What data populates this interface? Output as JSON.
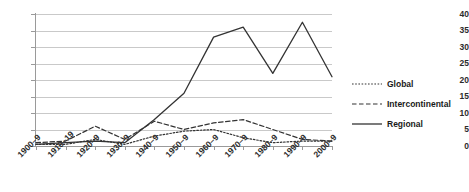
{
  "chart_data": {
    "type": "line",
    "title": "",
    "xlabel": "",
    "ylabel": "",
    "ylim": [
      0,
      40
    ],
    "ytick_step": 5,
    "grid": true,
    "legend_position": "right",
    "categories": [
      "1900–9",
      "1910–19",
      "1920–9",
      "1930–9",
      "1940–9",
      "1950–9",
      "1960–9",
      "1970–9",
      "1980–9",
      "1990–9",
      "2000–9"
    ],
    "ytick_labels": [
      "0",
      "5",
      "10",
      "15",
      "20",
      "25",
      "30",
      "35",
      "40"
    ],
    "series": [
      {
        "name": "Global",
        "style": "dotted",
        "color": "#333333",
        "values": [
          0.5,
          0.5,
          2.0,
          0.5,
          3.0,
          4.5,
          5.0,
          2.5,
          1.0,
          1.5,
          1.5
        ]
      },
      {
        "name": "Intercontinental",
        "style": "dashed",
        "color": "#333333",
        "values": [
          1.0,
          1.5,
          6.0,
          2.0,
          7.5,
          5.0,
          7.0,
          8.0,
          5.0,
          2.0,
          1.5
        ]
      },
      {
        "name": "Regional",
        "style": "solid",
        "color": "#333333",
        "values": [
          0.5,
          1.0,
          1.5,
          1.0,
          8.0,
          16.0,
          33.0,
          36.0,
          22.0,
          37.5,
          21.0
        ]
      }
    ]
  },
  "legend": {
    "items": [
      {
        "label": "Global"
      },
      {
        "label": "Intercontinental"
      },
      {
        "label": "Regional"
      }
    ]
  }
}
